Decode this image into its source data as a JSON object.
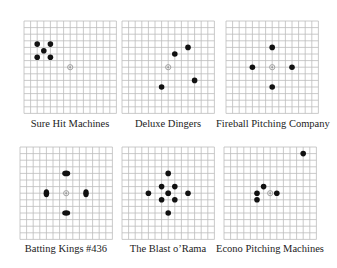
{
  "grid": {
    "cells": 14,
    "line_color": "#bdbdbd",
    "dot_color": "#111111",
    "bullseye_color": "#999999"
  },
  "panels": [
    {
      "name": "Sure Hit Machines",
      "hits": [
        [
          -5,
          3.5
        ],
        [
          -3,
          3.5
        ],
        [
          -4,
          2.5
        ],
        [
          -5,
          1.5
        ],
        [
          -3,
          1.5
        ]
      ]
    },
    {
      "name": "Deluxe Dingers",
      "hits": [
        [
          1,
          2
        ],
        [
          3,
          3
        ],
        [
          -1,
          -3
        ],
        [
          4,
          -2
        ]
      ]
    },
    {
      "name": "Fireball Pitching Company",
      "hits": [
        [
          0,
          3
        ],
        [
          -3,
          0
        ],
        [
          3,
          0
        ],
        [
          0,
          -3
        ]
      ]
    },
    {
      "name": "Batting Kings #436",
      "hits": [
        [
          0,
          3
        ],
        [
          -3,
          0
        ],
        [
          3,
          0
        ],
        [
          0,
          -3
        ]
      ],
      "smeared": true
    },
    {
      "name": "The Blast o’Rama",
      "hits": [
        [
          0,
          3
        ],
        [
          -1,
          1
        ],
        [
          1,
          1
        ],
        [
          -3,
          0
        ],
        [
          0,
          0
        ],
        [
          3,
          0
        ],
        [
          -1,
          -1
        ],
        [
          1,
          -1
        ],
        [
          0,
          -3
        ]
      ]
    },
    {
      "name": "Econo Pitching Machines",
      "hits": [
        [
          -1,
          1
        ],
        [
          -2,
          0
        ],
        [
          1,
          0
        ],
        [
          -2,
          -1
        ],
        [
          5,
          6
        ]
      ]
    }
  ]
}
